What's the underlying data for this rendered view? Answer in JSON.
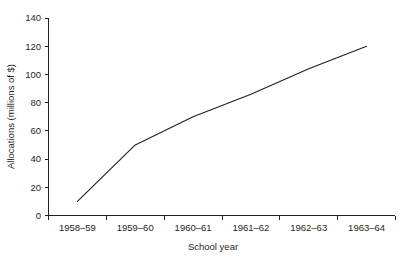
{
  "chart_data": {
    "type": "line",
    "title": "",
    "xlabel": "School year",
    "ylabel": "Allocations (millions of $)",
    "categories": [
      "1958–59",
      "1959–60",
      "1960–61",
      "1961–62",
      "1962–63",
      "1963–64"
    ],
    "values": [
      10,
      50,
      70,
      86,
      104,
      120
    ],
    "series": [
      {
        "name": "Allocations",
        "values": [
          10,
          50,
          70,
          86,
          104,
          120
        ]
      }
    ],
    "ylim": [
      0,
      140
    ],
    "yticks": [
      0,
      20,
      40,
      60,
      80,
      100,
      120,
      140
    ],
    "ytick_labels": [
      "0",
      "20",
      "40",
      "60",
      "80",
      "100",
      "120",
      "140"
    ],
    "grid": false,
    "legend": "none",
    "line_color": "#231f20",
    "background_color": "#ffffff"
  },
  "axes": {
    "y_title": "Allocations (millions of $)",
    "x_title": "School year",
    "y_tick_0": "0",
    "y_tick_1": "20",
    "y_tick_2": "40",
    "y_tick_3": "60",
    "y_tick_4": "80",
    "y_tick_5": "100",
    "y_tick_6": "120",
    "y_tick_7": "140",
    "x_tick_0": "1958–59",
    "x_tick_1": "1959–60",
    "x_tick_2": "1960–61",
    "x_tick_3": "1961–62",
    "x_tick_4": "1962–63",
    "x_tick_5": "1963–64"
  }
}
